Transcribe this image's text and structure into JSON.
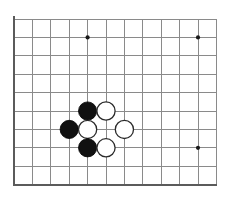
{
  "figure": {
    "kind": "go-board-diagram",
    "title": "",
    "background_color": "#ffffff",
    "width": 245,
    "height": 198
  },
  "board": {
    "columns": 12,
    "rows": 10,
    "origin_x": 14,
    "origin_y": 19,
    "cell_size": 18.4,
    "grid_color": "#8a8a8a",
    "edge_color": "#5b5b5b",
    "edges": {
      "left": true,
      "bottom": true,
      "top": false,
      "right": false
    },
    "star_point_color": "#1a1a1a",
    "star_point_radius": 2.1,
    "star_points": [
      {
        "col": 4,
        "row": 1
      },
      {
        "col": 10,
        "row": 1
      },
      {
        "col": 10,
        "row": 7
      }
    ]
  },
  "stones": {
    "radius": 9.1,
    "black_color": "#111111",
    "white_color": "#ffffff",
    "white_outline_color": "#2a2a2a",
    "items": [
      {
        "color": "black",
        "col": 4,
        "row": 5
      },
      {
        "color": "white",
        "col": 5,
        "row": 5
      },
      {
        "color": "black",
        "col": 3,
        "row": 6
      },
      {
        "color": "white",
        "col": 4,
        "row": 6
      },
      {
        "color": "white",
        "col": 6,
        "row": 6
      },
      {
        "color": "black",
        "col": 4,
        "row": 7
      },
      {
        "color": "white",
        "col": 5,
        "row": 7
      }
    ]
  },
  "counts": {
    "black_stones": 3,
    "white_stones": 4,
    "total_stones": 7
  }
}
